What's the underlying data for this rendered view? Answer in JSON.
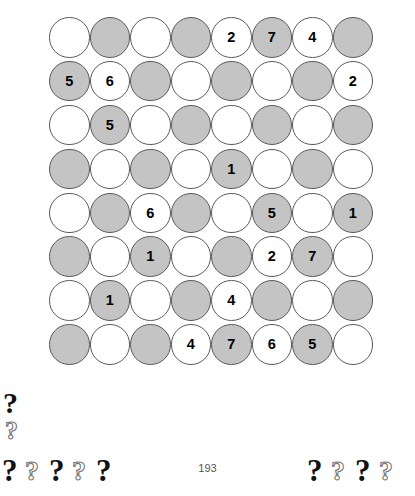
{
  "document": {
    "page_number": "193"
  },
  "puzzle": {
    "colors": {
      "light_cell": "#ffffff",
      "dark_cell": "#c4c4c4",
      "cell_border": "#5a5a5a",
      "digit": "#000000"
    },
    "rows": 8,
    "columns": 8,
    "grid": [
      [
        {
          "shade": "light",
          "value": ""
        },
        {
          "shade": "dark",
          "value": ""
        },
        {
          "shade": "light",
          "value": ""
        },
        {
          "shade": "dark",
          "value": ""
        },
        {
          "shade": "light",
          "value": "2"
        },
        {
          "shade": "dark",
          "value": "7"
        },
        {
          "shade": "light",
          "value": "4"
        },
        {
          "shade": "dark",
          "value": ""
        }
      ],
      [
        {
          "shade": "dark",
          "value": "5"
        },
        {
          "shade": "light",
          "value": "6"
        },
        {
          "shade": "dark",
          "value": ""
        },
        {
          "shade": "light",
          "value": ""
        },
        {
          "shade": "dark",
          "value": ""
        },
        {
          "shade": "light",
          "value": ""
        },
        {
          "shade": "dark",
          "value": ""
        },
        {
          "shade": "light",
          "value": "2"
        }
      ],
      [
        {
          "shade": "light",
          "value": ""
        },
        {
          "shade": "dark",
          "value": "5"
        },
        {
          "shade": "light",
          "value": ""
        },
        {
          "shade": "dark",
          "value": ""
        },
        {
          "shade": "light",
          "value": ""
        },
        {
          "shade": "dark",
          "value": ""
        },
        {
          "shade": "light",
          "value": ""
        },
        {
          "shade": "dark",
          "value": ""
        }
      ],
      [
        {
          "shade": "dark",
          "value": ""
        },
        {
          "shade": "light",
          "value": ""
        },
        {
          "shade": "dark",
          "value": ""
        },
        {
          "shade": "light",
          "value": ""
        },
        {
          "shade": "dark",
          "value": "1"
        },
        {
          "shade": "light",
          "value": ""
        },
        {
          "shade": "dark",
          "value": ""
        },
        {
          "shade": "light",
          "value": ""
        }
      ],
      [
        {
          "shade": "light",
          "value": ""
        },
        {
          "shade": "dark",
          "value": ""
        },
        {
          "shade": "light",
          "value": "6"
        },
        {
          "shade": "dark",
          "value": ""
        },
        {
          "shade": "light",
          "value": ""
        },
        {
          "shade": "dark",
          "value": "5"
        },
        {
          "shade": "light",
          "value": ""
        },
        {
          "shade": "dark",
          "value": "1"
        }
      ],
      [
        {
          "shade": "dark",
          "value": ""
        },
        {
          "shade": "light",
          "value": ""
        },
        {
          "shade": "dark",
          "value": "1"
        },
        {
          "shade": "light",
          "value": ""
        },
        {
          "shade": "dark",
          "value": ""
        },
        {
          "shade": "light",
          "value": "2"
        },
        {
          "shade": "dark",
          "value": "7"
        },
        {
          "shade": "light",
          "value": ""
        }
      ],
      [
        {
          "shade": "light",
          "value": ""
        },
        {
          "shade": "dark",
          "value": "1"
        },
        {
          "shade": "light",
          "value": ""
        },
        {
          "shade": "dark",
          "value": ""
        },
        {
          "shade": "light",
          "value": "4"
        },
        {
          "shade": "dark",
          "value": ""
        },
        {
          "shade": "light",
          "value": ""
        },
        {
          "shade": "dark",
          "value": ""
        }
      ],
      [
        {
          "shade": "dark",
          "value": ""
        },
        {
          "shade": "light",
          "value": ""
        },
        {
          "shade": "dark",
          "value": ""
        },
        {
          "shade": "light",
          "value": "4"
        },
        {
          "shade": "dark",
          "value": "7"
        },
        {
          "shade": "light",
          "value": "6"
        },
        {
          "shade": "dark",
          "value": "5"
        },
        {
          "shade": "light",
          "value": ""
        }
      ]
    ]
  },
  "artifacts": {
    "question_mark": "?",
    "marks": [
      {
        "id": "qm-a",
        "style": "solid"
      },
      {
        "id": "qm-b",
        "style": "outline"
      },
      {
        "id": "qm-c",
        "style": "solid"
      },
      {
        "id": "qm-d",
        "style": "outline"
      },
      {
        "id": "qm-e",
        "style": "solid"
      },
      {
        "id": "qm-f",
        "style": "outline"
      },
      {
        "id": "qm-g",
        "style": "solid"
      },
      {
        "id": "qm-h",
        "style": "solid"
      },
      {
        "id": "qm-i",
        "style": "outline"
      },
      {
        "id": "qm-j",
        "style": "solid"
      },
      {
        "id": "qm-k",
        "style": "outline"
      }
    ]
  }
}
